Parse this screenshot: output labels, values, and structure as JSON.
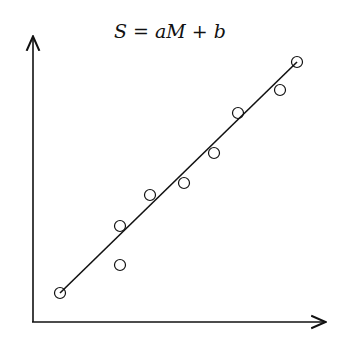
{
  "chart_data": {
    "type": "scatter",
    "title": "S = aM + b",
    "xlabel": "",
    "ylabel": "",
    "grid": false,
    "legend": null,
    "x": [
      1.0,
      2.0,
      2.0,
      2.5,
      3.1,
      3.6,
      4.0,
      4.7,
      5.0
    ],
    "y": [
      1.0,
      1.5,
      2.2,
      2.8,
      3.0,
      3.5,
      4.2,
      4.6,
      5.1
    ],
    "fit_line": {
      "x": [
        1.0,
        5.0
      ],
      "y": [
        1.0,
        5.1
      ]
    },
    "xlim": [
      0,
      5.5
    ],
    "ylim": [
      0,
      5.5
    ]
  },
  "pixels": {
    "points": [
      [
        60,
        293
      ],
      [
        120,
        265
      ],
      [
        120,
        226
      ],
      [
        150,
        195
      ],
      [
        184,
        183
      ],
      [
        214,
        153
      ],
      [
        238,
        113
      ],
      [
        280,
        90
      ],
      [
        297,
        62
      ]
    ],
    "line": [
      60,
      293,
      297,
      62
    ]
  }
}
